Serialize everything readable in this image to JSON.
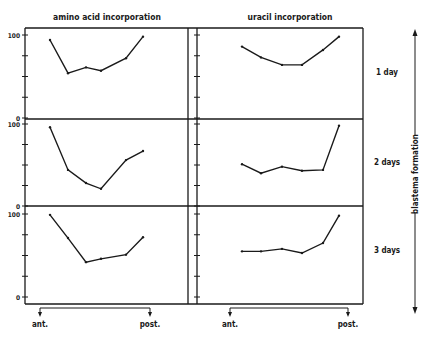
{
  "chart_data": {
    "type": "line",
    "layout": "3 rows x 2 columns small multiples",
    "columns": [
      {
        "title": "amino acid incorporation"
      },
      {
        "title": "uracil incorporation"
      }
    ],
    "rows": [
      {
        "label": "1 day"
      },
      {
        "label": "2 days"
      },
      {
        "label": "3 days"
      }
    ],
    "y_axis": {
      "ticks": [
        "100",
        "0"
      ],
      "ylim": [
        0,
        100
      ],
      "minor_ticks": 5
    },
    "x_axis": {
      "start_label": "ant.",
      "end_label": "post.",
      "points": 6
    },
    "side_label": "blastema formation",
    "grid": false,
    "panels": [
      {
        "row": "1 day",
        "column": "amino acid incorporation",
        "x": [
          1,
          2,
          3,
          4,
          5,
          6
        ],
        "values": [
          94,
          54,
          61,
          57,
          72,
          98
        ]
      },
      {
        "row": "1 day",
        "column": "uracil incorporation",
        "x": [
          1,
          2,
          3,
          4,
          5,
          6
        ],
        "values": [
          86,
          73,
          64,
          64,
          82,
          98
        ]
      },
      {
        "row": "2 days",
        "column": "amino acid incorporation",
        "x": [
          1,
          2,
          3,
          4,
          5,
          6
        ],
        "values": [
          96,
          44,
          28,
          21,
          56,
          67
        ]
      },
      {
        "row": "2 days",
        "column": "uracil incorporation",
        "x": [
          1,
          2,
          3,
          4,
          5,
          6
        ],
        "values": [
          51,
          40,
          48,
          43,
          44,
          98
        ]
      },
      {
        "row": "3 days",
        "column": "amino acid incorporation",
        "x": [
          1,
          2,
          3,
          4,
          5,
          6
        ],
        "values": [
          99,
          71,
          42,
          46,
          51,
          72
        ]
      },
      {
        "row": "3 days",
        "column": "uracil incorporation",
        "x": [
          1,
          2,
          3,
          4,
          5,
          6
        ],
        "values": [
          55,
          55,
          58,
          53,
          65,
          98
        ]
      }
    ]
  },
  "render": {
    "columns_x": [
      {
        "xs": [
          50,
          68,
          86,
          101,
          126,
          143
        ]
      },
      {
        "xs": [
          242,
          261,
          282,
          302,
          323,
          339
        ]
      }
    ],
    "rows_y": [
      {
        "y100": 35,
        "y0": 118
      },
      {
        "y100": 124,
        "y0": 206
      },
      {
        "y100": 214,
        "y0": 297
      }
    ]
  }
}
